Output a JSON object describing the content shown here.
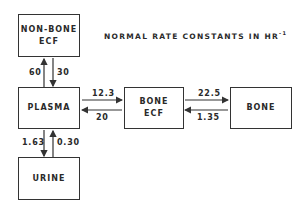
{
  "title": {
    "text": "NORMAL RATE CONSTANTS IN HR",
    "superscript": "-1"
  },
  "boxes": {
    "non_bone_ecf": {
      "line1": "NON-BONE",
      "line2": "ECF"
    },
    "plasma": {
      "label": "PLASMA"
    },
    "urine": {
      "label": "URINE"
    },
    "bone_ecf": {
      "line1": "BONE",
      "line2": "ECF"
    },
    "bone": {
      "label": "BONE"
    }
  },
  "rates": {
    "plasma_to_non_bone_ecf": "60",
    "non_bone_ecf_to_plasma": "30",
    "plasma_to_bone_ecf": "12.3",
    "bone_ecf_to_plasma": "20",
    "bone_ecf_to_bone": "22.5",
    "bone_to_bone_ecf": "1.35",
    "plasma_to_urine": "1.63",
    "urine_to_plasma": "0.30"
  },
  "colors": {
    "line": "#333333",
    "text": "#2a2a2a",
    "background": "#ffffff"
  }
}
